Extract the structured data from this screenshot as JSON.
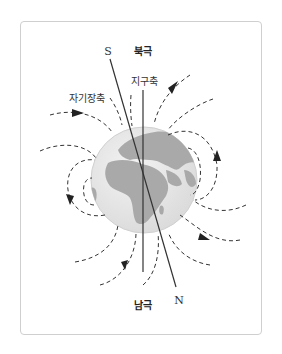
{
  "diagram": {
    "labels": {
      "north_pole": "북극",
      "south_pole": "남극",
      "earth_axis": "지구축",
      "magnetic_axis": "자기장축",
      "magnetic_s": "S",
      "magnetic_n": "N"
    },
    "colors": {
      "globe_ocean": "#e6e6e6",
      "globe_land": "#a9a9a9",
      "field_line": "#333333",
      "axis_line": "#333333",
      "frame_border": "#cfcfcf"
    },
    "icons": {
      "field_arrow": "arrowhead-icon",
      "globe": "globe-icon"
    }
  }
}
